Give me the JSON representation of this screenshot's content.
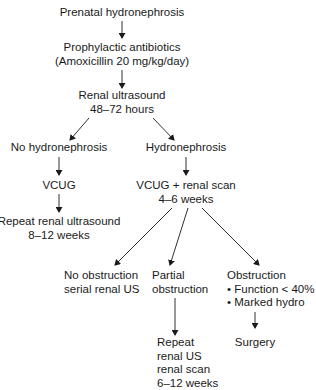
{
  "diagram": {
    "type": "flowchart",
    "nodes": {
      "prenatal": {
        "lines": [
          "Prenatal hydronephrosis"
        ]
      },
      "antibiotics": {
        "lines": [
          "Prophylactic antibiotics",
          "(Amoxicillin 20 mg/kg/day)"
        ]
      },
      "renal_us": {
        "lines": [
          "Renal ultrasound",
          "48–72 hours"
        ]
      },
      "no_hydro": {
        "lines": [
          "No hydronephrosis"
        ]
      },
      "hydro": {
        "lines": [
          "Hydronephrosis"
        ]
      },
      "vcug": {
        "lines": [
          "VCUG"
        ]
      },
      "vcug_scan": {
        "lines": [
          "VCUG + renal scan",
          "4–6 weeks"
        ]
      },
      "repeat_us": {
        "lines": [
          "Repeat renal ultrasound",
          "8–12 weeks"
        ]
      },
      "no_obstruction": {
        "lines": [
          "No obstruction",
          "serial renal US"
        ]
      },
      "partial": {
        "lines": [
          "Partial",
          "obstruction"
        ]
      },
      "obstruction": {
        "lines": [
          "Obstruction",
          "• Function < 40%",
          "• Marked hydro"
        ]
      },
      "repeat_scan": {
        "lines": [
          "Repeat",
          "renal US",
          "renal scan",
          "6–12 weeks"
        ]
      },
      "surgery": {
        "lines": [
          "Surgery"
        ]
      }
    },
    "edges": [
      [
        "prenatal",
        "antibiotics"
      ],
      [
        "antibiotics",
        "renal_us"
      ],
      [
        "renal_us",
        "no_hydro"
      ],
      [
        "renal_us",
        "hydro"
      ],
      [
        "no_hydro",
        "vcug"
      ],
      [
        "vcug",
        "repeat_us"
      ],
      [
        "hydro",
        "vcug_scan"
      ],
      [
        "vcug_scan",
        "no_obstruction"
      ],
      [
        "vcug_scan",
        "partial"
      ],
      [
        "vcug_scan",
        "obstruction"
      ],
      [
        "partial",
        "repeat_scan"
      ],
      [
        "obstruction",
        "surgery"
      ]
    ],
    "colors": {
      "line": "#1a1a1a",
      "text": "#1a1a1a",
      "background": "#ffffff"
    }
  }
}
